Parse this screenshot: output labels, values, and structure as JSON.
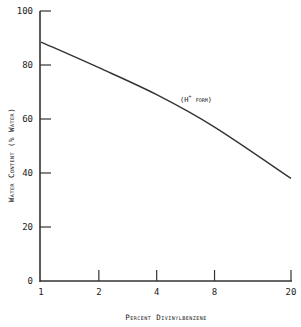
{
  "chart_data": {
    "type": "line",
    "title": "",
    "xlabel": "Percent Divinylbenzene",
    "ylabel": "Water Content (% Water)",
    "xscale": "log",
    "xlim": [
      1,
      20
    ],
    "ylim": [
      0,
      100
    ],
    "x_ticks": [
      1,
      2,
      4,
      8,
      20
    ],
    "x_tick_labels": [
      "1",
      "2",
      "4",
      "8",
      "20"
    ],
    "y_ticks": [
      0,
      20,
      40,
      60,
      80,
      100
    ],
    "y_tick_labels": [
      "0",
      "20",
      "40",
      "60",
      "80",
      "100"
    ],
    "grid": false,
    "legend": null,
    "series": [
      {
        "name": "H+ form",
        "x": [
          1,
          2,
          4,
          8,
          20
        ],
        "values": [
          88.5,
          79,
          69,
          57,
          38
        ]
      }
    ],
    "annotations": [
      {
        "text": "(H+ form)",
        "x": 5.6,
        "y": 66
      }
    ]
  },
  "labels": {
    "xlabel": "Percent Divinylbenzene",
    "ylabel": "Water Content (% Water)",
    "annotation_main": "(H",
    "annotation_sup": "+",
    "annotation_tail": " form)"
  }
}
